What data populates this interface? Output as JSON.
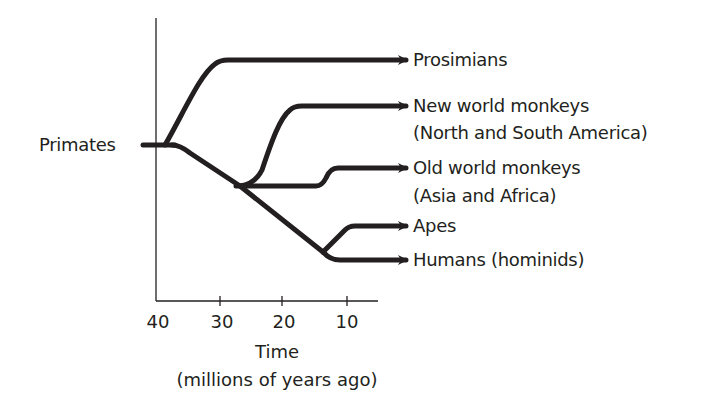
{
  "diagram": {
    "root_label": "Primates",
    "branches": [
      {
        "name": "prosimians",
        "line1": "Prosimians",
        "line2": ""
      },
      {
        "name": "new-world-monkeys",
        "line1": "New world monkeys",
        "line2": "(North and South America)"
      },
      {
        "name": "old-world-monkeys",
        "line1": "Old world monkeys",
        "line2": "(Asia and Africa)"
      },
      {
        "name": "apes",
        "line1": "Apes",
        "line2": ""
      },
      {
        "name": "humans",
        "line1": "Humans (hominids)",
        "line2": ""
      }
    ],
    "x_axis": {
      "ticks": [
        "40",
        "30",
        "20",
        "10"
      ],
      "title": "Time",
      "subtitle": "(millions of years ago)"
    },
    "colors": {
      "line": "#231f20",
      "background": "#ffffff"
    }
  }
}
